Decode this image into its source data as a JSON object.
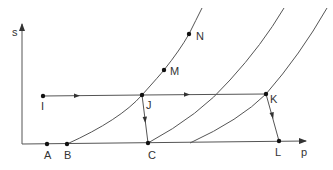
{
  "diagram": {
    "axes": {
      "y_label": "s",
      "x_label": "p"
    },
    "points": [
      {
        "id": "A",
        "label": "A",
        "x": 47,
        "y": 144
      },
      {
        "id": "B",
        "label": "B",
        "x": 67,
        "y": 144
      },
      {
        "id": "C",
        "label": "C",
        "x": 148,
        "y": 143
      },
      {
        "id": "L",
        "label": "L",
        "x": 279,
        "y": 141
      },
      {
        "id": "I",
        "label": "I",
        "x": 43,
        "y": 96
      },
      {
        "id": "J",
        "label": "J",
        "x": 142,
        "y": 95
      },
      {
        "id": "K",
        "label": "K",
        "x": 266,
        "y": 94
      },
      {
        "id": "M",
        "label": "M",
        "x": 164,
        "y": 70
      },
      {
        "id": "N",
        "label": "N",
        "x": 189,
        "y": 34
      }
    ],
    "curves": [
      {
        "name": "curve-1",
        "from": "B",
        "through": [
          "J",
          "M",
          "N"
        ]
      },
      {
        "name": "curve-2",
        "from": "C"
      },
      {
        "name": "curve-3",
        "through": [
          "K"
        ]
      }
    ],
    "paths": [
      {
        "name": "path-I-J-K",
        "from": "I",
        "to": "K",
        "arrow": "right"
      },
      {
        "name": "path-J-C",
        "from": "J",
        "to": "C",
        "arrow": "down"
      },
      {
        "name": "path-K-L",
        "from": "K",
        "to": "L",
        "arrow": "down"
      }
    ]
  }
}
